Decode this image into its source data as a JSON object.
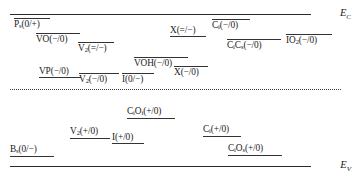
{
  "diagram": {
    "bands": {
      "conduction_label": "E",
      "conduction_sub": "C",
      "valence_label": "E",
      "valence_sub": "V"
    },
    "midgap_line": "dotted"
  },
  "levels": [
    {
      "id": "ps",
      "base": "P",
      "sub": "s",
      "charge": "(0/+)",
      "text": "Ps(0/+)",
      "tick": "above",
      "x": 14,
      "y": 18,
      "width": 36
    },
    {
      "id": "vo",
      "base": "VO",
      "sub": "",
      "charge": "(−/0)",
      "text": "VO(−/0)",
      "tick": "above",
      "x": 36,
      "y": 33,
      "width": 44
    },
    {
      "id": "v2-double",
      "base": "V",
      "sub": "2",
      "charge": "(=/−)",
      "text": "V2(=/−)",
      "tick": "above",
      "x": 78,
      "y": 42,
      "width": 36
    },
    {
      "id": "x-double",
      "base": "X",
      "sub": "",
      "charge": "(=/−)",
      "text": "X(=/−)",
      "tick": "below",
      "x": 170,
      "y": 26,
      "width": 36
    },
    {
      "id": "ci-minus",
      "base": "C",
      "sub": "i",
      "charge": "(−/0)",
      "text": "Ci(−/0)",
      "tick": "above",
      "x": 212,
      "y": 19,
      "width": 38
    },
    {
      "id": "cics",
      "base": "C",
      "sub": "i",
      "base2": "C",
      "sub2": "s",
      "charge": "(−/0)",
      "text": "CiCs(−/0)",
      "tick": "above",
      "x": 227,
      "y": 39,
      "width": 54
    },
    {
      "id": "io2",
      "base": "IO",
      "sub": "2",
      "charge": "(−/0)",
      "text": "IO2(−/0)",
      "tick": "above",
      "x": 286,
      "y": 34,
      "width": 46
    },
    {
      "id": "voh",
      "base": "VOH",
      "sub": "",
      "charge": "(−/0)",
      "text": "VOH(−/0)",
      "tick": "above",
      "x": 134,
      "y": 57,
      "width": 54
    },
    {
      "id": "x-minus",
      "base": "X",
      "sub": "",
      "charge": "(−/0)",
      "text": "X(−/0)",
      "tick": "above",
      "x": 174,
      "y": 66,
      "width": 34
    },
    {
      "id": "vp",
      "base": "VP",
      "sub": "",
      "charge": "(−/0)",
      "text": "VP(−/0)",
      "tick": "below",
      "x": 39,
      "y": 67,
      "width": 42
    },
    {
      "id": "v2-minus",
      "base": "V",
      "sub": "2",
      "charge": "(−/0)",
      "text": "V2(−/0)",
      "tick": "above",
      "x": 79,
      "y": 73,
      "width": 40
    },
    {
      "id": "i-zero",
      "base": "I",
      "sub": "",
      "charge": "(0/−)",
      "text": "I(0/−)",
      "tick": "above",
      "x": 122,
      "y": 73,
      "width": 32
    },
    {
      "id": "cioi",
      "base": "C",
      "sub": "i",
      "base2": "O",
      "sub2": "i",
      "charge": "(+/0)",
      "text": "CiOi(+/0)",
      "tick": "below",
      "x": 127,
      "y": 107,
      "width": 48
    },
    {
      "id": "v2-plus",
      "base": "V",
      "sub": "2",
      "charge": "(+/0)",
      "text": "V2(+/0)",
      "tick": "below",
      "x": 70,
      "y": 127,
      "width": 40
    },
    {
      "id": "i-plus",
      "base": "I",
      "sub": "",
      "charge": "(+/0)",
      "text": "I(+/0)",
      "tick": "below",
      "x": 112,
      "y": 133,
      "width": 32
    },
    {
      "id": "ci-plus",
      "base": "C",
      "sub": "i",
      "charge": "(+/0)",
      "text": "Ci(+/0)",
      "tick": "below",
      "x": 203,
      "y": 125,
      "width": 38
    },
    {
      "id": "cios",
      "base": "C",
      "sub": "i",
      "base2": "O",
      "sub2": "s",
      "charge": "(+/0)",
      "text": "CiOs (+/0)",
      "tick": "below",
      "x": 228,
      "y": 144,
      "width": 54
    },
    {
      "id": "bs",
      "base": "B",
      "sub": "s",
      "charge": "(0/−)",
      "text": "Bs (0/−)",
      "tick": "below",
      "x": 10,
      "y": 145,
      "width": 44
    }
  ]
}
